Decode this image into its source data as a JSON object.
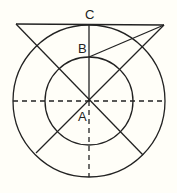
{
  "diagram": {
    "type": "geometry-concentric-circles",
    "colors": {
      "background": "#fffef8",
      "stroke": "#222222"
    },
    "center": {
      "x": 89,
      "y": 101
    },
    "outer_radius": 76,
    "inner_radius": 44,
    "labels": {
      "A": "A",
      "B": "B",
      "C": "C"
    },
    "points": {
      "A": {
        "x": 89,
        "y": 101
      },
      "B": {
        "x": 89,
        "y": 57
      },
      "C": {
        "x": 89,
        "y": 25
      },
      "top_left": {
        "x": 16,
        "y": 24
      },
      "top_right": {
        "x": 164,
        "y": 25
      }
    }
  }
}
